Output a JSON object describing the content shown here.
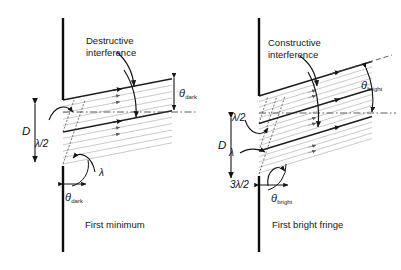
{
  "figure": {
    "type": "physics-diagram",
    "topic": "single-slit-diffraction",
    "panels": [
      {
        "id": "left",
        "caption": "First minimum",
        "interference_label_line1": "Destructive",
        "interference_label_line2": "interference",
        "angle_symbol": "θ",
        "angle_subscript": "dark",
        "slit_width_label": "D",
        "path_diff_labels": [
          "λ/2",
          "λ"
        ],
        "bottom_angle_symbol": "θ",
        "bottom_angle_subscript": "dark",
        "ray_angle_deg": 11,
        "barrier_x": 63,
        "slit_top_y": 100,
        "slit_bottom_y": 166,
        "ray_groups": 2
      },
      {
        "id": "right",
        "caption": "First bright fringe",
        "interference_label_line1": "Constructive",
        "interference_label_line2": "interference",
        "angle_symbol": "θ",
        "angle_subscript": "bright",
        "slit_width_label": "D",
        "path_diff_labels": [
          "λ/2",
          "λ",
          "3λ/2"
        ],
        "bottom_angle_symbol": "θ",
        "bottom_angle_subscript": "bright",
        "ray_angle_deg": 17,
        "barrier_x": 259,
        "slit_top_y": 96,
        "slit_bottom_y": 176,
        "ray_groups": 3
      }
    ],
    "colors": {
      "barrier": "#0d0d0d",
      "ray_dark": "#1f1f1f",
      "ray_light": "#b9b9b9",
      "ray_mid": "#8f8f8f",
      "dashed": "#4a4a4a",
      "text": "#161616",
      "background": "#ffffff"
    }
  }
}
